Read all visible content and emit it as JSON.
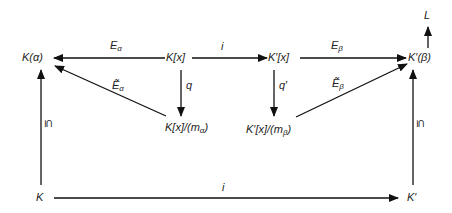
{
  "diagram": {
    "type": "commutative-diagram",
    "nodes": {
      "K_alpha": "K(α)",
      "Kx": "K[x]",
      "Kpx": "K′[x]",
      "Kp_beta": "K′(β)",
      "L": "L",
      "Kx_quot": "K[x]/(m",
      "Kx_quot_sub": "α",
      "Kx_quot_end": ")",
      "Kpx_quot": "K′[x]/(m",
      "Kpx_quot_sub": "β",
      "Kpx_quot_end": ")",
      "K": "K",
      "Kp": "K′"
    },
    "edge_labels": {
      "E_alpha": "E",
      "E_alpha_sub": "α",
      "i_top": "i",
      "E_beta": "E",
      "E_beta_sub": "β",
      "q": "q",
      "q_prime": "q′",
      "Etilde_alpha": "Ẽ",
      "Etilde_alpha_sub": "α",
      "Etilde_beta": "Ẽ",
      "Etilde_beta_sub": "β",
      "subset_left": "⊆",
      "subset_right": "⊆",
      "i_bottom": "i"
    },
    "edges": [
      {
        "from": "K[x]",
        "to": "K(α)",
        "label": "E_α"
      },
      {
        "from": "K[x]",
        "to": "K′[x]",
        "label": "i"
      },
      {
        "from": "K′[x]",
        "to": "K′(β)",
        "label": "E_β"
      },
      {
        "from": "K′(β)",
        "to": "L",
        "label": ""
      },
      {
        "from": "K[x]",
        "to": "K[x]/(m_α)",
        "label": "q"
      },
      {
        "from": "K′[x]",
        "to": "K′[x]/(m_β)",
        "label": "q′"
      },
      {
        "from": "K[x]/(m_α)",
        "to": "K(α)",
        "label": "Ẽ_α"
      },
      {
        "from": "K′[x]/(m_β)",
        "to": "K′(β)",
        "label": "Ẽ_β"
      },
      {
        "from": "K",
        "to": "K(α)",
        "label": "⊆"
      },
      {
        "from": "K′",
        "to": "K′(β)",
        "label": "⊆"
      },
      {
        "from": "K",
        "to": "K′",
        "label": "i"
      }
    ]
  }
}
